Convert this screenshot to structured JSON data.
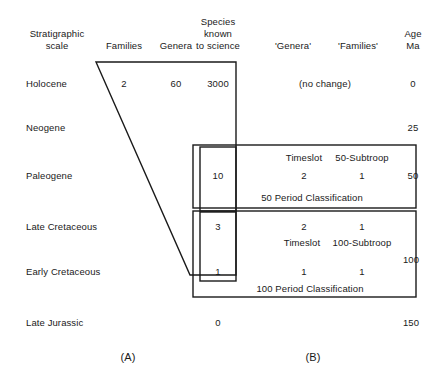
{
  "figure": {
    "panel_a_label": "(A)",
    "panel_b_label": "(B)"
  },
  "headers": {
    "stratigraphic_scale_line1": "Stratigraphic",
    "stratigraphic_scale_line2": "scale",
    "families": "Families",
    "genera": "Genera",
    "species_line1": "Species",
    "species_line2": "known",
    "species_line3": "to science",
    "genera_quoted": "'Genera'",
    "families_quoted": "'Families'",
    "age_line1": "Age",
    "age_line2": "Ma"
  },
  "rows": [
    {
      "stage": "Holocene",
      "families": "2",
      "genera": "60",
      "species": "3000",
      "age": "0"
    },
    {
      "stage": "Neogene",
      "families": "",
      "genera": "",
      "species": "",
      "age": "25"
    },
    {
      "stage": "Paleogene",
      "families": "",
      "genera": "",
      "species": "10",
      "age": "50"
    },
    {
      "stage": "Late Cretaceous",
      "families": "",
      "genera": "",
      "species": "3",
      "age": ""
    },
    {
      "stage": "Early Cretaceous",
      "families": "",
      "genera": "",
      "species": "1",
      "age": "100"
    },
    {
      "stage": "Late Jurassic",
      "families": "",
      "genera": "",
      "species": "0",
      "age": "150"
    }
  ],
  "panel_b": {
    "holocene_note": "(no change)",
    "box_50": {
      "header_genera": "Timeslot",
      "header_families": "50-Subtroop",
      "value_genera": "2",
      "value_families": "1",
      "caption": "50 Period Classification"
    },
    "box_100": {
      "top_value_genera": "2",
      "top_value_families": "1",
      "header_genera": "Timeslot",
      "header_families": "100-Subtroop",
      "value_genera": "1",
      "value_families": "1",
      "caption": "100 Period Classification"
    }
  },
  "colors": {
    "line": "#1a1a1a",
    "text": "#1a1a1a",
    "background": "#ffffff"
  }
}
